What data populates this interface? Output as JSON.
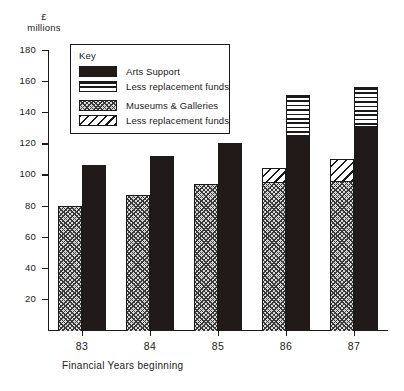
{
  "chart_data": {
    "type": "bar",
    "title": "",
    "xlabel": "Financial Years beginning",
    "ylabel": "£ millions",
    "ylabel_lines": [
      "£",
      "millions"
    ],
    "categories": [
      "83",
      "84",
      "85",
      "86",
      "87"
    ],
    "ylim": [
      0,
      180
    ],
    "yticks": [
      20,
      40,
      60,
      80,
      100,
      120,
      140,
      160,
      180
    ],
    "grid": false,
    "legend_position": "top-left-inset",
    "legend_title": "Key",
    "series": [
      {
        "name": "Museums & Galleries",
        "pattern": "cross-hatch",
        "group": "left",
        "values": [
          80,
          87,
          94,
          95,
          96
        ]
      },
      {
        "name": "Less replacement funds",
        "pattern": "diagonal-stripe",
        "group": "left",
        "values": [
          0,
          0,
          0,
          9,
          14
        ],
        "totals": [
          80,
          87,
          94,
          104,
          110
        ]
      },
      {
        "name": "Arts Support",
        "pattern": "solid-black",
        "group": "right",
        "values": [
          106,
          112,
          120,
          126,
          132
        ]
      },
      {
        "name": "Less replacement funds",
        "pattern": "horizontal-stripe",
        "group": "right",
        "values": [
          0,
          0,
          0,
          25,
          24
        ],
        "totals": [
          106,
          112,
          120,
          151,
          156
        ]
      }
    ]
  },
  "legend": {
    "title": "Key",
    "entries": [
      {
        "label": "Arts Support",
        "pattern": "solid-black"
      },
      {
        "label": "Less replacement funds",
        "pattern": "horizontal-stripe"
      },
      {
        "label": "Museums & Galleries",
        "pattern": "cross-hatch"
      },
      {
        "label": "Less replacement funds",
        "pattern": "diagonal-stripe"
      }
    ]
  },
  "colors": {
    "ink": "#1a1a1a",
    "solid_fill": "#211a18",
    "cross_fill": "#d8d8d8",
    "paper": "#ffffff"
  }
}
